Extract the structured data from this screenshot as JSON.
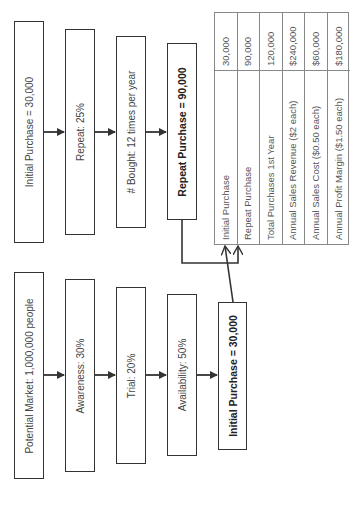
{
  "top_row": [
    {
      "label": "Initial Purchase = 30,000",
      "bold": false
    },
    {
      "label": "Repeat:  25%",
      "bold": false
    },
    {
      "label": "# Bought:  12 times per year",
      "bold": false
    },
    {
      "label": "Repeat Purchase = 90,000",
      "bold": true
    }
  ],
  "bottom_row": [
    {
      "label": "Potential Market:  1,000,000 people",
      "bold": false
    },
    {
      "label": "Awareness:  30%",
      "bold": false
    },
    {
      "label": "Trial:  20%",
      "bold": false
    },
    {
      "label": "Availability:  50%",
      "bold": false
    },
    {
      "label": "Initial Purchase = 30,000",
      "bold": true
    }
  ],
  "summary_table": {
    "rows": [
      {
        "label": "Initial Purchase",
        "value": "30,000"
      },
      {
        "label": "Repeat Purchase",
        "value": "90,000"
      },
      {
        "label": "Total Purchases 1st Year",
        "value": "120,000"
      },
      {
        "label": "Annual Sales Revenue ($2 each)",
        "value": "$240,000"
      },
      {
        "label": "Annual Sales Cost ($0.50 each)",
        "value": "$60,000"
      },
      {
        "label": "Annual Profit Margin ($1.50 each)",
        "value": "$180,000"
      }
    ]
  },
  "colors": {
    "line": "#333333",
    "table_border": "#888888",
    "text": "#444444"
  }
}
